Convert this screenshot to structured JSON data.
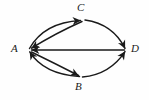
{
  "figure": {
    "type": "directed-multigraph",
    "background_color": "#fefefe",
    "stroke_color": "#1a1a1a",
    "label_color": "#1a1a1a",
    "width": 149,
    "height": 100
  },
  "vertices": [
    {
      "id": "A",
      "label": "A",
      "x": 28,
      "y": 50
    },
    {
      "id": "C",
      "label": "C",
      "x": 83,
      "y": 19
    },
    {
      "id": "B",
      "label": "B",
      "x": 80,
      "y": 78
    },
    {
      "id": "D",
      "label": "D",
      "x": 126,
      "y": 50
    }
  ],
  "edges": [
    {
      "id": "e1",
      "from": "A",
      "to": "C",
      "shape": "curve-upper",
      "arrow_at": "C"
    },
    {
      "id": "e2",
      "from": "C",
      "to": "A",
      "shape": "curve-lower",
      "arrow_at": "A"
    },
    {
      "id": "e3",
      "from": "A",
      "to": "B",
      "shape": "curve-lower",
      "arrow_at": "B"
    },
    {
      "id": "e4",
      "from": "B",
      "to": "A",
      "shape": "curve-upper",
      "arrow_at": "A"
    },
    {
      "id": "e5",
      "from": "C",
      "to": "D",
      "shape": "curve-upper",
      "arrow_at": "D"
    },
    {
      "id": "e6",
      "from": "B",
      "to": "D",
      "shape": "curve-lower",
      "arrow_at": "D"
    },
    {
      "id": "e7",
      "from": "D",
      "to": "A",
      "shape": "straight",
      "arrow_at": "A"
    }
  ]
}
